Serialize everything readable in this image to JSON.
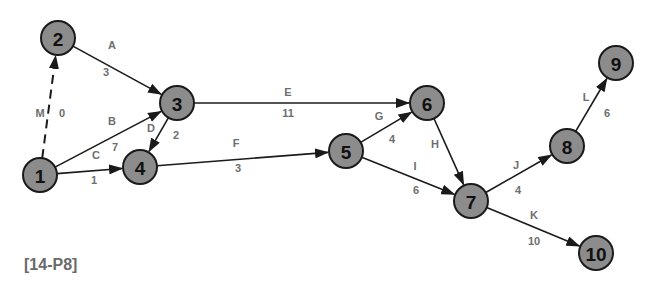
{
  "diagram": {
    "type": "activity-on-arrow network",
    "caption": "[14-P8]",
    "colors": {
      "node_fill": "#8c8c8c",
      "node_stroke": "#1a1a1a",
      "edge": "#1a1a1a",
      "label": "#6e6e6e"
    },
    "nodes": [
      {
        "id": "1",
        "label": "1",
        "x": 40,
        "y": 175
      },
      {
        "id": "2",
        "label": "2",
        "x": 58,
        "y": 38
      },
      {
        "id": "3",
        "label": "3",
        "x": 177,
        "y": 103
      },
      {
        "id": "4",
        "label": "4",
        "x": 140,
        "y": 167
      },
      {
        "id": "5",
        "label": "5",
        "x": 346,
        "y": 151
      },
      {
        "id": "6",
        "label": "6",
        "x": 427,
        "y": 103
      },
      {
        "id": "7",
        "label": "7",
        "x": 471,
        "y": 201
      },
      {
        "id": "8",
        "label": "8",
        "x": 567,
        "y": 146
      },
      {
        "id": "9",
        "label": "9",
        "x": 616,
        "y": 63
      },
      {
        "id": "10",
        "label": "10",
        "x": 596,
        "y": 253
      }
    ],
    "edges": [
      {
        "activity": "A",
        "duration": "3",
        "from": "2",
        "to": "3",
        "dashed": false,
        "lx": 112,
        "ly": 45,
        "dx": 106,
        "dy": 72
      },
      {
        "activity": "B",
        "duration": "7",
        "from": "1",
        "to": "3",
        "dashed": false,
        "lx": 112,
        "ly": 121,
        "dx": 115,
        "dy": 147
      },
      {
        "activity": "C",
        "duration": "1",
        "from": "1",
        "to": "4",
        "dashed": false,
        "lx": 96,
        "ly": 155,
        "dx": 94,
        "dy": 180
      },
      {
        "activity": "D",
        "duration": "2",
        "from": "3",
        "to": "4",
        "dashed": false,
        "lx": 151,
        "ly": 128,
        "dx": 176,
        "dy": 135
      },
      {
        "activity": "E",
        "duration": "11",
        "from": "3",
        "to": "6",
        "dashed": false,
        "lx": 288,
        "ly": 92,
        "dx": 288,
        "dy": 113
      },
      {
        "activity": "F",
        "duration": "3",
        "from": "4",
        "to": "5",
        "dashed": false,
        "lx": 236,
        "ly": 143,
        "dx": 238,
        "dy": 168
      },
      {
        "activity": "G",
        "duration": "4",
        "from": "5",
        "to": "6",
        "dashed": false,
        "lx": 379,
        "ly": 116,
        "dx": 392,
        "dy": 139
      },
      {
        "activity": "H",
        "duration": "",
        "from": "6",
        "to": "7",
        "dashed": false,
        "lx": 435,
        "ly": 144,
        "dx": null,
        "dy": null
      },
      {
        "activity": "I",
        "duration": "6",
        "from": "5",
        "to": "7",
        "dashed": false,
        "lx": 415,
        "ly": 166,
        "dx": 416,
        "dy": 190
      },
      {
        "activity": "J",
        "duration": "4",
        "from": "7",
        "to": "8",
        "dashed": false,
        "lx": 516,
        "ly": 165,
        "dx": 518,
        "dy": 190
      },
      {
        "activity": "K",
        "duration": "10",
        "from": "7",
        "to": "10",
        "dashed": false,
        "lx": 534,
        "ly": 215,
        "dx": 534,
        "dy": 241
      },
      {
        "activity": "L",
        "duration": "6",
        "from": "8",
        "to": "9",
        "dashed": false,
        "lx": 586,
        "ly": 97,
        "dx": 607,
        "dy": 113
      },
      {
        "activity": "M",
        "duration": "0",
        "from": "1",
        "to": "2",
        "dashed": true,
        "lx": 40,
        "ly": 113,
        "dx": 62,
        "dy": 113
      }
    ]
  }
}
